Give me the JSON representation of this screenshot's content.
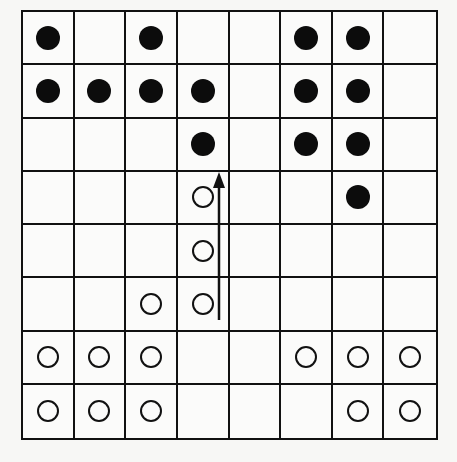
{
  "board": {
    "rows": 8,
    "cols": 8,
    "legend": {
      "B": "black-piece",
      "W": "white-piece",
      ".": "empty"
    },
    "cells": [
      [
        "B",
        ".",
        "B",
        ".",
        ".",
        "B",
        "B",
        "."
      ],
      [
        "B",
        "B",
        "B",
        "B",
        ".",
        "B",
        "B",
        "."
      ],
      [
        ".",
        ".",
        ".",
        "B",
        ".",
        "B",
        "B",
        "."
      ],
      [
        ".",
        ".",
        ".",
        "W",
        ".",
        ".",
        "B",
        "."
      ],
      [
        ".",
        ".",
        ".",
        "W",
        ".",
        ".",
        ".",
        "."
      ],
      [
        ".",
        ".",
        "W",
        "W",
        ".",
        ".",
        ".",
        "."
      ],
      [
        "W",
        "W",
        "W",
        ".",
        ".",
        "W",
        "W",
        "W"
      ],
      [
        "W",
        "W",
        "W",
        ".",
        ".",
        ".",
        "W",
        "W"
      ]
    ]
  },
  "move_arrow": {
    "column": 3,
    "from_row": 5,
    "to_row": 3,
    "direction": "up"
  },
  "colors": {
    "line": "#111111",
    "black_piece": "#0c0c0c",
    "background": "#f7f7f5"
  }
}
